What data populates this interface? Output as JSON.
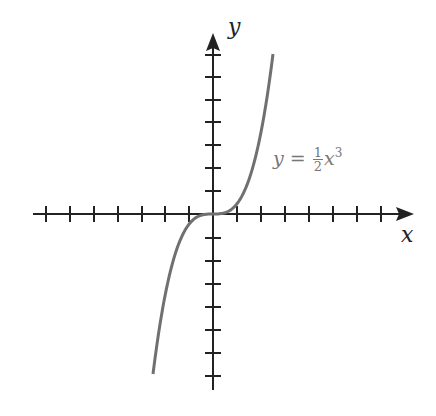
{
  "chart_data": {
    "type": "line",
    "title": "",
    "xlabel": "x",
    "ylabel": "y",
    "equation": "y = 1/2 x^3",
    "series": [
      {
        "name": "y = 1/2 x^3",
        "x": [
          -2.5,
          -2,
          -1.5,
          -1,
          -0.5,
          0,
          0.5,
          1,
          1.5,
          2,
          2.5
        ],
        "values": [
          -7.81,
          -4,
          -1.69,
          -0.5,
          -0.06,
          0,
          0.06,
          0.5,
          1.69,
          4,
          7.81
        ]
      }
    ],
    "xlim": [
      -7,
      8
    ],
    "ylim": [
      -8,
      8
    ],
    "x_ticks_count": 14,
    "y_ticks_count": 14,
    "grid": false,
    "tick_labels": false,
    "curve_color": "#707070",
    "axis_color": "#222222"
  },
  "labels": {
    "x_axis": "x",
    "y_axis": "y",
    "eq_lhs": "y =",
    "eq_num": "1",
    "eq_den": "2",
    "eq_var": "x",
    "eq_exp": "3"
  }
}
